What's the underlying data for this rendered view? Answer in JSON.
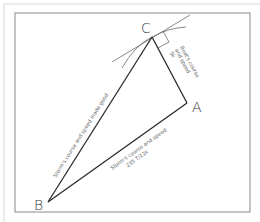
{
  "diagram": {
    "type": "vector-triangle",
    "points": {
      "A": {
        "label": "A",
        "x": 187,
        "y": 103
      },
      "B": {
        "label": "B",
        "x": 48,
        "y": 202
      },
      "C": {
        "label": "C",
        "x": 152,
        "y": 37
      }
    },
    "edges": [
      {
        "from": "B",
        "to": "C",
        "label_line1": "Storm's course and speed made good",
        "label_line2": ""
      },
      {
        "from": "B",
        "to": "A",
        "label_line1": "Storm's course and speed",
        "label_line2": "235 T/12k"
      },
      {
        "from": "C",
        "to": "A",
        "label_line1": "Boat's course",
        "label_line2": "and speed",
        "label_line3": "5k"
      }
    ],
    "annotations": {
      "right_angle_at": "C",
      "arcs_at": "C"
    },
    "colors": {
      "lines": "#2a2a2a",
      "text": "#666666",
      "frame": "#8a8a8a"
    }
  }
}
